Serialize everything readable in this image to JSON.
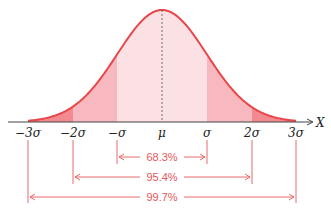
{
  "chart_data": {
    "type": "area",
    "title": "",
    "xlabel": "X",
    "ylabel": "",
    "grid": false,
    "distribution": "normal",
    "tick_labels": [
      "−3σ",
      "−2σ",
      "−σ",
      "μ",
      "σ",
      "2σ",
      "3σ"
    ],
    "x": [
      -3,
      -2,
      -1,
      0,
      1,
      2,
      3
    ],
    "intervals": [
      {
        "range": [
          "−σ",
          "σ"
        ],
        "label": "68.3%",
        "value": 68.3
      },
      {
        "range": [
          "−2σ",
          "2σ"
        ],
        "label": "95.4%",
        "value": 95.4
      },
      {
        "range": [
          "−3σ",
          "3σ"
        ],
        "label": "99.7%",
        "value": 99.7
      }
    ],
    "colors": {
      "curve": "#e8474a",
      "band1": "#fbe0e4",
      "band2": "#f7b9bf",
      "band3": "#f28a90",
      "annot": "#e8585a"
    }
  },
  "axis": {
    "label": "X"
  },
  "ticks": [
    "−3σ",
    "−2σ",
    "−σ",
    "μ",
    "σ",
    "2σ",
    "3σ"
  ],
  "intervals": [
    "68.3%",
    "95.4%",
    "99.7%"
  ]
}
